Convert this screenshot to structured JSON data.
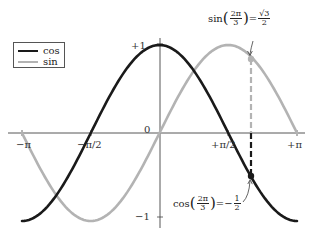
{
  "chart_data": {
    "type": "line",
    "title": "",
    "xlabel": "",
    "ylabel": "",
    "xlim": [
      -3.14159,
      3.14159
    ],
    "ylim": [
      -1,
      1
    ],
    "grid": false,
    "legend_position": "upper-left",
    "x_ticks": [
      "-π",
      "-π/2",
      "0",
      "+π/2",
      "+π"
    ],
    "y_ticks": [
      "+1",
      "0",
      "-1"
    ],
    "series": [
      {
        "name": "cos",
        "color": "#1a1a1a",
        "function": "cos(x)",
        "x": [
          -3.1416,
          -2.3562,
          -1.5708,
          -0.7854,
          0,
          0.7854,
          1.5708,
          2.0944,
          2.3562,
          3.1416
        ],
        "values": [
          -1,
          -0.707,
          0,
          0.707,
          1,
          0.707,
          0,
          -0.5,
          -0.707,
          -1
        ]
      },
      {
        "name": "sin",
        "color": "#b3b3b3",
        "function": "sin(x)",
        "x": [
          -3.1416,
          -2.3562,
          -1.5708,
          -0.7854,
          0,
          0.7854,
          1.5708,
          2.0944,
          2.3562,
          3.1416
        ],
        "values": [
          0,
          -0.707,
          -1,
          -0.707,
          0,
          0.707,
          1,
          0.866,
          0.707,
          0
        ]
      }
    ],
    "annotations": [
      {
        "text": "sin(2π/3) = √3/2",
        "x": 2.0944,
        "y": 0.866,
        "series": "sin"
      },
      {
        "text": "cos(2π/3) = −1/2",
        "x": 2.0944,
        "y": -0.5,
        "series": "cos"
      }
    ],
    "reference_line": {
      "x": 2.0944,
      "style": "dashed"
    }
  },
  "axis": {
    "x_labels": [
      "−π",
      "−π/2",
      "0",
      "+π/2",
      "+π"
    ],
    "y_top": "+1",
    "y_bottom": "−1"
  },
  "legend": {
    "items": [
      {
        "label": "cos",
        "color": "#1a1a1a"
      },
      {
        "label": "sin",
        "color": "#b3b3b3"
      }
    ]
  },
  "annotations": {
    "sin": {
      "fn": "sin",
      "num": "2π",
      "den": "3",
      "eq": "=",
      "rnum": "√3",
      "rden": "2"
    },
    "cos": {
      "fn": "cos",
      "num": "2π",
      "den": "3",
      "eq": "=−",
      "rnum": "1",
      "rden": "2"
    }
  }
}
